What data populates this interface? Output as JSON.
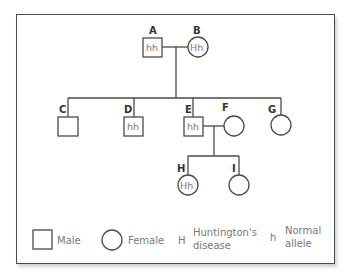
{
  "diagram": {
    "type": "pedigree",
    "individuals": {
      "A": {
        "label": "A",
        "sex": "male",
        "genotype": "hh"
      },
      "B": {
        "label": "B",
        "sex": "female",
        "genotype": "Hh"
      },
      "C": {
        "label": "C",
        "sex": "male",
        "genotype": ""
      },
      "D": {
        "label": "D",
        "sex": "male",
        "genotype": "hh"
      },
      "E": {
        "label": "E",
        "sex": "male",
        "genotype": "hh"
      },
      "F": {
        "label": "F",
        "sex": "female",
        "genotype": ""
      },
      "G": {
        "label": "G",
        "sex": "female",
        "genotype": ""
      },
      "H": {
        "label": "H",
        "sex": "female",
        "genotype": "Hh"
      },
      "I": {
        "label": "I",
        "sex": "female",
        "genotype": ""
      }
    },
    "matings": [
      {
        "partners": [
          "A",
          "B"
        ],
        "children": [
          "C",
          "D",
          "E",
          "G"
        ]
      },
      {
        "partners": [
          "E",
          "F"
        ],
        "children": [
          "H",
          "I"
        ]
      }
    ]
  },
  "legend": {
    "male": "Male",
    "female": "Female",
    "dominant_symbol": "H",
    "dominant_line1": "Huntington's",
    "dominant_line2": "disease",
    "recessive_symbol": "h",
    "recessive_line1": "Normal",
    "recessive_line2": "allele"
  },
  "colors": {
    "stroke": "#4a4a4a",
    "genotype_text": "#7a7a7a",
    "label_text": "#333333"
  }
}
